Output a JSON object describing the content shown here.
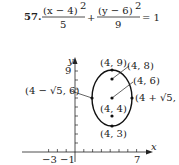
{
  "problem": {
    "number": "57.",
    "num1": "(x − 4)",
    "exp1": "2",
    "den1": "5",
    "plus": "+",
    "num2": "(y − 6)",
    "exp2": "2",
    "den2": "9",
    "equals": "= 1"
  },
  "graph": {
    "x_axis_label": "x",
    "y_axis_label": "y",
    "x_ticks": [
      "−3",
      "−1",
      "7"
    ],
    "y_ticks": [
      "9"
    ],
    "points": [
      {
        "label": "(4, 9)"
      },
      {
        "label": "(4, 8)"
      },
      {
        "label": "(4, 6)"
      },
      {
        "label": "(4 − √5, 6)"
      },
      {
        "label": "(4 + √5, 6)"
      },
      {
        "label": "(4, 4)"
      },
      {
        "label": "(4, 3)"
      }
    ]
  }
}
